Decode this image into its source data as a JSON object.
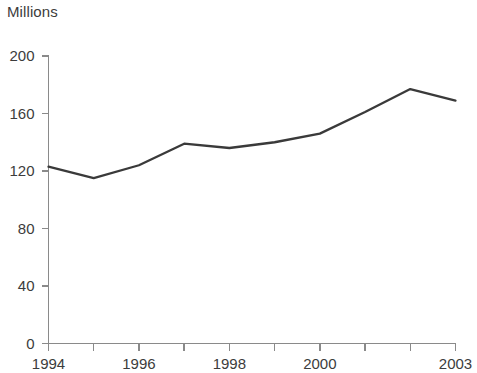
{
  "chart_data": {
    "type": "line",
    "title": "Millions",
    "xlabel": "",
    "ylabel": "",
    "x": [
      1994,
      1995,
      1996,
      1997,
      1998,
      1999,
      2000,
      2001,
      2002,
      2003
    ],
    "values": [
      123,
      115,
      124,
      139,
      136,
      140,
      146,
      161,
      177,
      169
    ],
    "series": [
      {
        "name": "Millions",
        "values": [
          123,
          115,
          124,
          139,
          136,
          140,
          146,
          161,
          177,
          169
        ]
      }
    ],
    "xlim": [
      1994,
      2003
    ],
    "ylim": [
      0,
      200
    ],
    "x_ticks": [
      1994,
      1995,
      1996,
      1997,
      1998,
      1999,
      2000,
      2001,
      2002,
      2003
    ],
    "x_tick_labels": [
      "1994",
      "",
      "1996",
      "",
      "1998",
      "",
      "2000",
      "",
      "",
      "2003"
    ],
    "y_ticks": [
      0,
      40,
      80,
      120,
      160,
      200
    ],
    "y_tick_labels": [
      "0",
      "40",
      "80",
      "120",
      "160",
      "200"
    ],
    "grid": false,
    "legend": "none",
    "line_color": "#3a3a3a",
    "axis_color": "#8a8a8a",
    "text_color": "#3c3c3c",
    "background": "#ffffff"
  },
  "axis": {
    "y_labels": [
      {
        "text": "200",
        "value": 200
      },
      {
        "text": "160",
        "value": 160
      },
      {
        "text": "120",
        "value": 120
      },
      {
        "text": "80",
        "value": 80
      },
      {
        "text": "40",
        "value": 40
      },
      {
        "text": "0",
        "value": 0
      }
    ],
    "x_labels": [
      {
        "text": "1994",
        "value": 1994
      },
      {
        "text": "1996",
        "value": 1996
      },
      {
        "text": "1998",
        "value": 1998
      },
      {
        "text": "2000",
        "value": 2000
      },
      {
        "text": "2003",
        "value": 2003
      }
    ]
  }
}
